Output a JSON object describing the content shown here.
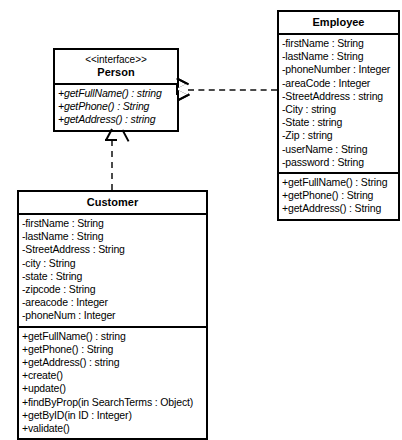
{
  "diagram": {
    "type": "uml-class-diagram",
    "classes": [
      {
        "id": "person",
        "stereotype": "<<interface>>",
        "name": "Person",
        "attributes": [],
        "methods": [
          "+getFullName() : string",
          "+getPhone() : String",
          "+getAddress() : string"
        ]
      },
      {
        "id": "employee",
        "stereotype": "",
        "name": "Employee",
        "attributes": [
          "-firstName : String",
          "-lastName : String",
          "-phoneNumber : Integer",
          "-areaCode : Integer",
          "-StreetAddress : string",
          "-City : string",
          "-State : string",
          "-Zip : string",
          "-userName : String",
          "-password : String"
        ],
        "methods": [
          "+getFullName() : String",
          "+getPhone() : String",
          "+getAddress() : String"
        ]
      },
      {
        "id": "customer",
        "stereotype": "",
        "name": "Customer",
        "attributes": [
          "-firstName : String",
          "-lastName : String",
          "-StreetAddress : String",
          "-city : String",
          "-state : String",
          "-zipcode : String",
          "-areacode : Integer",
          "-phoneNum : Integer"
        ],
        "methods": [
          "+getFullName() : string",
          "+getPhone() : String",
          "+getAddress() : string",
          "+create()",
          "+update()",
          "+findByProp(in SearchTerms : Object)",
          "+getByID(in ID : Integer)",
          "+validate()"
        ]
      }
    ],
    "relationships": [
      {
        "id": "employee-realizes-person",
        "kind": "realization",
        "from": "employee",
        "to": "person",
        "line": "dashed",
        "arrowhead": "hollow-triangle"
      },
      {
        "id": "customer-realizes-person",
        "kind": "realization",
        "from": "customer",
        "to": "person",
        "line": "dashed",
        "arrowhead": "hollow-triangle"
      }
    ],
    "colors": {
      "stroke": "#000000",
      "background": "#ffffff",
      "connector": "#4a4a4a"
    }
  }
}
